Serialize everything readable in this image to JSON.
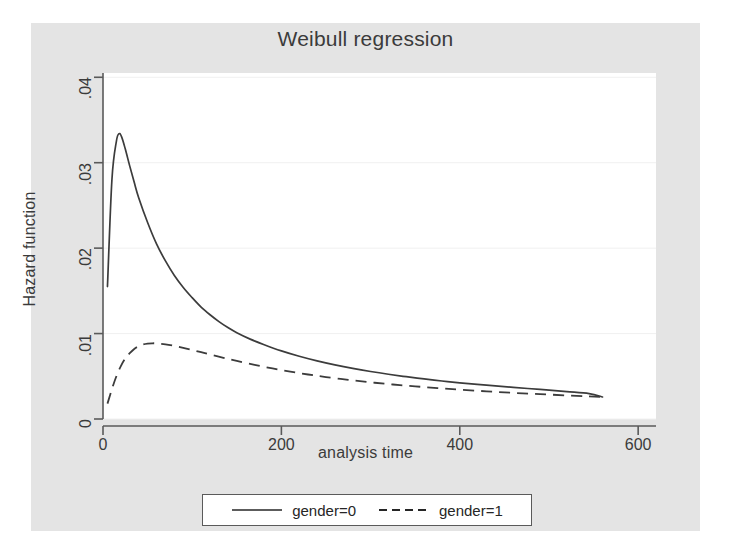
{
  "chart": {
    "title": "Weibull regression",
    "xlabel": "analysis time",
    "ylabel": "Hazard function"
  },
  "axes": {
    "y_ticks": [
      "0",
      ".01",
      ".02",
      ".03",
      ".04"
    ],
    "x_ticks": [
      "0",
      "200",
      "400",
      "600"
    ]
  },
  "legend": {
    "items": [
      {
        "label": "gender=0",
        "style": "solid"
      },
      {
        "label": "gender=1",
        "style": "dashed"
      }
    ]
  },
  "colors": {
    "background": "#ffffff",
    "graph_region": "#e4e4e4",
    "plot_region": "#ffffff",
    "axis": "#5a5a5a",
    "grid": "#f0f0f0",
    "series_0": "#3c3c3c",
    "series_1": "#3c3c3c",
    "text": "#3b3b3b"
  },
  "chart_data": {
    "type": "line",
    "title": "Weibull regression",
    "xlabel": "analysis time",
    "ylabel": "Hazard function",
    "xlim": [
      0,
      620
    ],
    "ylim": [
      0,
      0.0405
    ],
    "grid": true,
    "legend_position": "bottom",
    "series": [
      {
        "name": "gender=0",
        "style": "solid",
        "x": [
          5,
          10,
          15,
          18,
          21,
          25,
          30,
          35,
          40,
          50,
          60,
          70,
          80,
          90,
          100,
          110,
          120,
          130,
          140,
          150,
          165,
          180,
          200,
          220,
          240,
          260,
          280,
          300,
          320,
          340,
          360,
          380,
          400,
          430,
          460,
          490,
          520,
          545,
          560
        ],
        "y": [
          0.0155,
          0.028,
          0.0325,
          0.0334,
          0.033,
          0.0316,
          0.0296,
          0.0277,
          0.0259,
          0.023,
          0.0205,
          0.0185,
          0.0168,
          0.0154,
          0.0142,
          0.0131,
          0.0122,
          0.0114,
          0.0107,
          0.0101,
          0.00935,
          0.00872,
          0.00797,
          0.00734,
          0.0068,
          0.00633,
          0.00592,
          0.00556,
          0.00524,
          0.00495,
          0.00469,
          0.00445,
          0.00424,
          0.00396,
          0.0037,
          0.00346,
          0.00321,
          0.00298,
          0.00258
        ]
      },
      {
        "name": "gender=1",
        "style": "dashed",
        "x": [
          5,
          10,
          15,
          20,
          25,
          30,
          35,
          40,
          45,
          50,
          55,
          60,
          70,
          80,
          90,
          100,
          110,
          120,
          135,
          150,
          170,
          190,
          210,
          230,
          250,
          275,
          300,
          325,
          350,
          375,
          400,
          430,
          460,
          490,
          520,
          545,
          560
        ],
        "y": [
          0.0018,
          0.0035,
          0.005,
          0.0062,
          0.0071,
          0.0077,
          0.0082,
          0.00852,
          0.00872,
          0.00882,
          0.00886,
          0.00885,
          0.00874,
          0.00856,
          0.00833,
          0.00808,
          0.00782,
          0.00755,
          0.00716,
          0.00679,
          0.00634,
          0.00592,
          0.00555,
          0.00521,
          0.00491,
          0.00458,
          0.00429,
          0.00404,
          0.00382,
          0.00362,
          0.00344,
          0.00324,
          0.00306,
          0.00291,
          0.00276,
          0.00265,
          0.00258
        ]
      }
    ]
  }
}
